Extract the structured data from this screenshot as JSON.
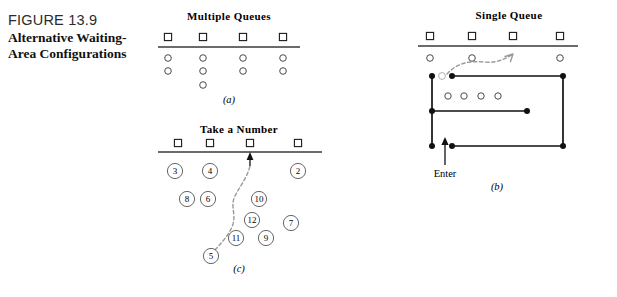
{
  "figure": {
    "number": "FIGURE 13.9",
    "title_line1": "Alternative Waiting-",
    "title_line2": "Area Configurations"
  },
  "panels": {
    "a": {
      "heading": "Multiple Queues",
      "letter": "(a)",
      "stations": [
        {
          "label": "service-station-1",
          "x": 168
        },
        {
          "label": "service-station-2",
          "x": 203
        },
        {
          "label": "service-station-3",
          "x": 243
        },
        {
          "label": "service-station-4",
          "x": 283
        }
      ],
      "counter_line": {
        "x1": 158,
        "x2": 300,
        "y": 47
      },
      "queue_columns": [
        {
          "x": 168,
          "count": 2
        },
        {
          "x": 203,
          "count": 3
        },
        {
          "x": 243,
          "count": 2
        },
        {
          "x": 283,
          "count": 2
        }
      ],
      "row_ys": [
        58,
        71,
        85
      ]
    },
    "b": {
      "heading": "Single  Queue",
      "letter": "(b)",
      "enter_label": "Enter",
      "stations": [
        {
          "label": "service-station-1",
          "x": 430
        },
        {
          "label": "service-station-2",
          "x": 472
        },
        {
          "label": "service-station-3",
          "x": 513
        },
        {
          "label": "service-station-4",
          "x": 560
        }
      ],
      "counter_line": {
        "x1": 418,
        "x2": 578,
        "y": 46
      },
      "served_people": [
        {
          "x": 430,
          "y": 58
        },
        {
          "x": 472,
          "y": 58
        },
        {
          "x": 560,
          "y": 58
        }
      ],
      "queued_people": [
        {
          "x": 448,
          "y": 96
        },
        {
          "x": 464,
          "y": 96
        },
        {
          "x": 481,
          "y": 96
        },
        {
          "x": 498,
          "y": 96
        }
      ],
      "posts": [
        {
          "x": 432,
          "y": 76
        },
        {
          "x": 452,
          "y": 76
        },
        {
          "x": 563,
          "y": 76
        },
        {
          "x": 432,
          "y": 111
        },
        {
          "x": 527,
          "y": 111
        },
        {
          "x": 432,
          "y": 146
        },
        {
          "x": 452,
          "y": 146
        },
        {
          "x": 563,
          "y": 146
        }
      ],
      "head_person": {
        "x": 442,
        "y": 76
      }
    },
    "c": {
      "heading": "Take a Number",
      "letter": "(c)",
      "stations": [
        {
          "label": "service-station-1",
          "x": 178
        },
        {
          "label": "service-station-2",
          "x": 210
        },
        {
          "label": "service-station-3",
          "x": 250
        },
        {
          "label": "service-station-4",
          "x": 298
        }
      ],
      "counter_line": {
        "x1": 158,
        "x2": 322,
        "y": 152
      },
      "tickets": [
        {
          "number": "3",
          "x": 175,
          "y": 171
        },
        {
          "number": "4",
          "x": 210,
          "y": 171
        },
        {
          "number": "2",
          "x": 298,
          "y": 171
        },
        {
          "number": "8",
          "x": 187,
          "y": 199
        },
        {
          "number": "6",
          "x": 208,
          "y": 199
        },
        {
          "number": "10",
          "x": 259,
          "y": 199
        },
        {
          "number": "12",
          "x": 252,
          "y": 220
        },
        {
          "number": "7",
          "x": 291,
          "y": 223
        },
        {
          "number": "11",
          "x": 236,
          "y": 238
        },
        {
          "number": "9",
          "x": 266,
          "y": 238
        },
        {
          "number": "5",
          "x": 211,
          "y": 256
        }
      ]
    }
  },
  "colors": {
    "ink": "#111111",
    "counter": "#3a3a3a",
    "dashed_path": "#9a9a9a",
    "person_outline": "#4a4a4a"
  }
}
